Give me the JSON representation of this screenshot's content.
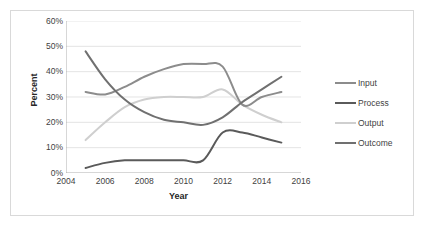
{
  "chart_data": {
    "type": "line",
    "title": "",
    "xlabel": "Year",
    "ylabel": "Percent",
    "xlim": [
      2004,
      2016
    ],
    "ylim": [
      0,
      60
    ],
    "grid": true,
    "legend_position": "right",
    "x_tick_labels": [
      "2004",
      "2006",
      "2008",
      "2010",
      "2012",
      "2014",
      "2016"
    ],
    "x_ticks": [
      2004,
      2006,
      2008,
      2010,
      2012,
      2014,
      2016
    ],
    "y_tick_labels": [
      "0%",
      "10%",
      "20%",
      "30%",
      "40%",
      "50%",
      "60%"
    ],
    "y_ticks": [
      0,
      10,
      20,
      30,
      40,
      50,
      60
    ],
    "x": [
      2005,
      2006,
      2007,
      2008,
      2009,
      2010,
      2011,
      2012,
      2013,
      2014,
      2015
    ],
    "series": [
      {
        "name": "Input",
        "color": "#8c8c8c",
        "values": [
          32,
          31,
          34,
          38,
          41,
          43,
          43,
          42,
          27,
          30,
          32
        ]
      },
      {
        "name": "Process",
        "color": "#5a5a5a",
        "values": [
          2,
          4,
          5,
          5,
          5,
          5,
          5,
          16,
          16,
          14,
          12
        ]
      },
      {
        "name": "Output",
        "color": "#cfcfcf",
        "values": [
          13,
          20,
          26,
          29,
          30,
          30,
          30,
          33,
          27,
          23,
          20
        ]
      },
      {
        "name": "Outcome",
        "color": "#707070",
        "values": [
          48,
          37,
          29,
          24,
          21,
          20,
          19,
          22,
          28,
          33,
          38
        ]
      }
    ]
  },
  "legend": {
    "items": [
      {
        "label": "Input",
        "color": "#8c8c8c"
      },
      {
        "label": "Process",
        "color": "#5a5a5a"
      },
      {
        "label": "Output",
        "color": "#cfcfcf"
      },
      {
        "label": "Outcome",
        "color": "#707070"
      }
    ]
  }
}
